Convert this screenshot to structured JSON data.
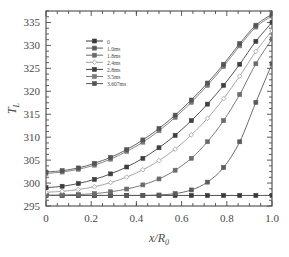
{
  "chart_data": {
    "type": "line",
    "title": "",
    "xlabel": "x/R",
    "xlabel_sub": "0",
    "ylabel": "T",
    "ylabel_sub": "L",
    "xlim": [
      0,
      1.0
    ],
    "ylim": [
      295,
      337.5
    ],
    "xticks": [
      0,
      0.2,
      0.4,
      0.6,
      0.8,
      1.0
    ],
    "xticklabels": [
      "0",
      "0.2",
      "0.4",
      "0.6",
      "0.8",
      "1.0"
    ],
    "yticks": [
      295,
      300,
      305,
      310,
      315,
      320,
      325,
      330,
      335
    ],
    "yticklabels": [
      "295",
      "300",
      "305",
      "310",
      "315",
      "320",
      "325",
      "330",
      "335"
    ],
    "grid": false,
    "legend_position": "upper-left-inside",
    "x": [
      0.0,
      0.0714,
      0.1429,
      0.2143,
      0.2857,
      0.3571,
      0.4286,
      0.5,
      0.5714,
      0.6429,
      0.7143,
      0.7857,
      0.8571,
      0.9286,
      1.0
    ],
    "series": [
      {
        "name": "0",
        "color": "#3b3b3b",
        "marker": "square",
        "values": [
          297.3,
          297.3,
          297.3,
          297.3,
          297.3,
          297.3,
          297.3,
          297.3,
          297.3,
          297.3,
          297.3,
          297.3,
          297.3,
          297.3,
          297.3
        ]
      },
      {
        "name": "1.0ms",
        "color": "#5a5a5a",
        "marker": "square",
        "values": [
          297.3,
          297.3,
          297.3,
          297.3,
          297.3,
          297.3,
          297.32,
          297.4,
          297.7,
          298.5,
          300.2,
          303.4,
          309.0,
          317.6,
          326.0
        ]
      },
      {
        "name": "1.8ms",
        "color": "#6b6b6b",
        "marker": "square",
        "values": [
          297.35,
          297.4,
          297.5,
          297.7,
          298.1,
          298.7,
          299.6,
          300.9,
          302.8,
          305.4,
          309.0,
          313.6,
          319.3,
          326.0,
          331.4
        ]
      },
      {
        "name": "2.4ms",
        "color": "#9d9d9d",
        "marker": "diamond",
        "values": [
          298.0,
          298.2,
          298.6,
          299.2,
          300.1,
          301.3,
          302.9,
          304.9,
          307.4,
          310.5,
          314.1,
          318.4,
          323.3,
          328.7,
          333.2
        ]
      },
      {
        "name": "2.8ms",
        "color": "#3f3f3f",
        "marker": "square",
        "values": [
          299.0,
          299.3,
          299.9,
          300.8,
          302.0,
          303.5,
          305.4,
          307.7,
          310.4,
          313.6,
          317.2,
          321.3,
          325.9,
          330.9,
          335.0
        ]
      },
      {
        "name": "3.5ms",
        "color": "#7a7a7a",
        "marker": "square",
        "values": [
          302.1,
          302.4,
          303.0,
          303.9,
          305.2,
          306.9,
          308.9,
          311.4,
          314.3,
          317.6,
          321.3,
          325.4,
          329.9,
          334.0,
          336.4
        ]
      },
      {
        "name": "3.607ms",
        "color": "#555555",
        "marker": "square",
        "values": [
          302.4,
          302.7,
          303.3,
          304.3,
          305.6,
          307.3,
          309.4,
          311.9,
          314.8,
          318.1,
          321.8,
          325.9,
          330.4,
          334.4,
          336.8
        ]
      }
    ]
  }
}
